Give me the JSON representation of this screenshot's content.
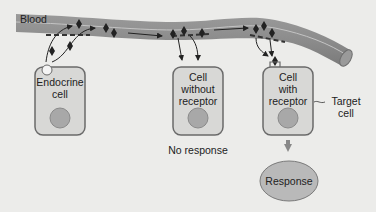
{
  "colors": {
    "background": "#ececea",
    "vessel": "#8a8a8a",
    "vessel_highlight": "#b0b0b0",
    "cell_fill": "#d8d8d6",
    "cell_border": "#6a6a6a",
    "nucleus": "#a8a8a8",
    "hormone": "#222222",
    "response_fill": "#b9b9b9"
  },
  "labels": {
    "blood": "Blood",
    "endocrine_cell": [
      "Endocrine",
      "cell"
    ],
    "cell_without_receptor": [
      "Cell",
      "without",
      "receptor"
    ],
    "cell_with_receptor": [
      "Cell",
      "with",
      "receptor"
    ],
    "target_cell": [
      "Target",
      "cell"
    ],
    "no_response": "No response",
    "response": "Response"
  }
}
